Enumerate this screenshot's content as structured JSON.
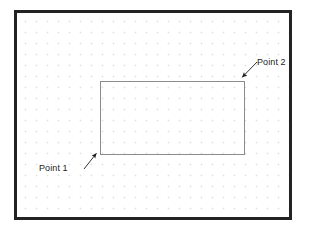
{
  "figure": {
    "type": "technical-drawing",
    "background_color": "#ffffff",
    "frame": {
      "name": "drawing-frame",
      "border_color": "#232323",
      "border_width_px": 3,
      "x": 14,
      "y": 10,
      "width": 278,
      "height": 210
    },
    "grid": {
      "name": "dot-grid",
      "style": "dotted",
      "dot_color": "#e3e3e3",
      "spacing_px": 11
    },
    "shape": {
      "name": "drawn-rectangle",
      "kind": "rectangle",
      "stroke_color": "#8c8c8c",
      "stroke_width_px": 1,
      "fill": "none",
      "x": 97,
      "y": 78,
      "width": 145,
      "height": 74,
      "corners": {
        "top_left": [
          97,
          78
        ],
        "top_right": [
          242,
          78
        ],
        "bottom_right": [
          242,
          152
        ],
        "bottom_left": [
          97,
          152
        ]
      }
    },
    "annotations": [
      {
        "id": "point-1",
        "label": "Point 1",
        "label_x": 39,
        "label_y": 163,
        "arrow_color": "#1d1d1d",
        "arrow_from": [
          84,
          169
        ],
        "arrow_to": [
          97,
          153
        ],
        "targets_corner": "bottom_left"
      },
      {
        "id": "point-2",
        "label": "Point 2",
        "label_x": 257,
        "label_y": 57,
        "arrow_color": "#1d1d1d",
        "arrow_from": [
          257,
          62
        ],
        "arrow_to": [
          241,
          78
        ],
        "targets_corner": "top_right"
      }
    ]
  }
}
